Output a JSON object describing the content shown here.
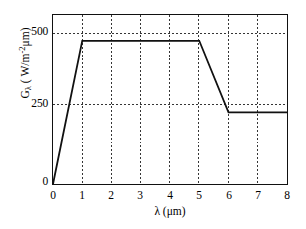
{
  "chart_data": {
    "type": "line",
    "title": "",
    "xlabel": "λ (μm)",
    "ylabel": "Gλ (W/m²·μm)",
    "ylabel_base": "G",
    "ylabel_sub": "λ",
    "ylabel_units_pre": " ( W/m",
    "ylabel_units_exp": "-2",
    "ylabel_units_post": "μm)",
    "xlim": [
      0,
      8
    ],
    "ylim": [
      0,
      590
    ],
    "grid": true,
    "grid_style": "dotted",
    "legend": "none",
    "xticks": [
      0,
      1,
      2,
      3,
      4,
      5,
      6,
      7,
      8
    ],
    "xtick_labels": [
      "0",
      "1",
      "2",
      "3",
      "4",
      "5",
      "6",
      "7",
      "8"
    ],
    "yticks": [
      0,
      250,
      500
    ],
    "ytick_labels": [
      "0",
      "250",
      "500"
    ],
    "series": [
      {
        "name": "spectral-irradiance",
        "color": "#111111",
        "x": [
          0,
          1,
          5,
          6,
          8
        ],
        "y": [
          0,
          500,
          500,
          250,
          250
        ]
      }
    ],
    "annotations": []
  },
  "axis": {
    "x_title": "λ (μm)",
    "y_title": "Gλ ( W/m⁻²μm)"
  },
  "colors": {
    "line": "#111111",
    "frame": "#111111",
    "grid": "#333333",
    "background": "#ffffff"
  }
}
